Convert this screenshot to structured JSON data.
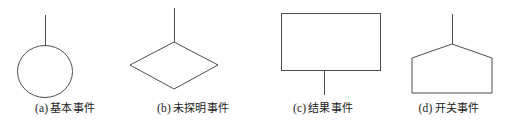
{
  "figure": {
    "background_color": "#ffffff",
    "stroke_color": "#4d4d4d",
    "text_color": "#1a1a1a"
  },
  "symbols": [
    {
      "tag": "(a)",
      "name": "基本事件",
      "caption": "(a) 基本事件",
      "shape": "circle",
      "icon_name": "circle-basic-event-shape",
      "connector": "up"
    },
    {
      "tag": "(b)",
      "name": "未探明事件",
      "caption": "(b) 未探明事件",
      "shape": "diamond",
      "icon_name": "diamond-undeveloped-event-shape",
      "connector": "up"
    },
    {
      "tag": "(c)",
      "name": "结果事件",
      "caption": "(c) 结果事件",
      "shape": "rectangle",
      "icon_name": "rectangle-result-event-shape",
      "connector": "down"
    },
    {
      "tag": "(d)",
      "name": "开关事件",
      "caption": "(d) 开关事件",
      "shape": "pentagon",
      "icon_name": "pentagon-switch-event-shape",
      "connector": "up"
    }
  ]
}
